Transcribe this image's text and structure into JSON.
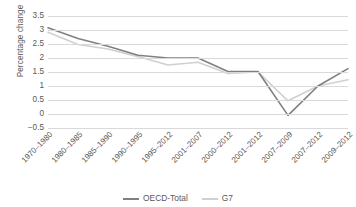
{
  "chart_data": {
    "type": "line",
    "title": "",
    "xlabel": "",
    "ylabel": "Percentage change",
    "ylim": [
      -0.5,
      3.5
    ],
    "yticks": [
      "3.5",
      "3",
      "2.5",
      "2",
      "1.5",
      "1",
      "0.5",
      "0",
      "−0.5"
    ],
    "ytick_values": [
      3.5,
      3,
      2.5,
      2,
      1.5,
      1,
      0.5,
      0,
      -0.5
    ],
    "grid": true,
    "legend_position": "bottom",
    "categories": [
      "1970–1980",
      "1980–1985",
      "1985–1990",
      "1990–1995",
      "1995–2012",
      "2001–2007",
      "2000–2012",
      "2001–2012",
      "2007–2009",
      "2007–2012",
      "2009–2012"
    ],
    "series": [
      {
        "name": "OECD-Total",
        "color": "#808080",
        "values": [
          3.08,
          2.7,
          2.42,
          2.1,
          2.0,
          2.0,
          1.52,
          1.52,
          -0.05,
          1.0,
          1.62
        ]
      },
      {
        "name": "G7",
        "color": "#d0d0d0",
        "values": [
          2.92,
          2.48,
          2.32,
          2.05,
          1.75,
          1.85,
          1.45,
          1.5,
          0.47,
          1.0,
          1.22
        ]
      }
    ]
  },
  "colors": {
    "gridline": "#d9d9d9",
    "text": "#595959",
    "background": "#ffffff"
  }
}
